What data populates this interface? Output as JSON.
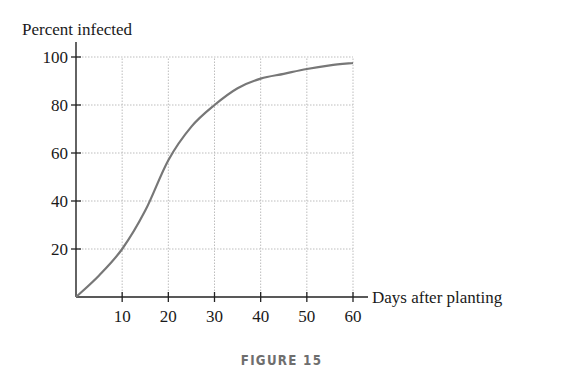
{
  "figure": {
    "caption": "FIGURE 15"
  },
  "chart_data": {
    "type": "line",
    "title": "",
    "xlabel": "Days after planting",
    "ylabel": "Percent infected",
    "xlim": [
      0,
      60
    ],
    "ylim": [
      0,
      100
    ],
    "x_ticks": [
      10,
      20,
      30,
      40,
      50,
      60
    ],
    "y_ticks": [
      20,
      40,
      60,
      80,
      100
    ],
    "grid": true,
    "legend": null,
    "series": [
      {
        "name": "Percent infected",
        "x": [
          0,
          5,
          10,
          15,
          20,
          25,
          30,
          35,
          40,
          45,
          50,
          55,
          60
        ],
        "values": [
          0,
          9,
          20,
          36,
          57,
          71,
          80,
          87,
          91,
          93,
          95,
          96.5,
          97.5
        ]
      }
    ]
  },
  "colors": {
    "axis": "#222222",
    "grid": "#bdbdbd",
    "curve": "#777777",
    "caption": "#6e6e6e"
  }
}
